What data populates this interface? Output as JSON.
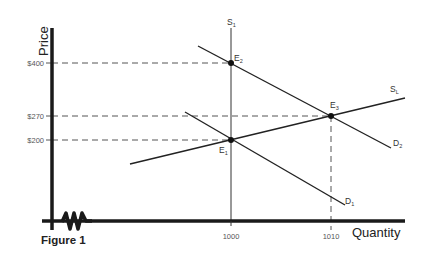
{
  "figure": {
    "caption": "Figure 1",
    "x_axis_title": "Quantity",
    "y_axis_title": "Price"
  },
  "y_ticks": [
    {
      "label": "$400",
      "value": 400
    },
    {
      "label": "$270",
      "value": 270
    },
    {
      "label": "$200",
      "value": 200
    }
  ],
  "x_ticks": [
    {
      "label": "1000",
      "value": 1000
    },
    {
      "label": "1010",
      "value": 1010
    }
  ],
  "curves": {
    "s1": {
      "main": "S",
      "sub": "1",
      "type": "short-run supply (vertical)"
    },
    "sl": {
      "main": "S",
      "sub": "L",
      "type": "long-run supply"
    },
    "d1": {
      "main": "D",
      "sub": "1",
      "type": "demand"
    },
    "d2": {
      "main": "D",
      "sub": "2",
      "type": "demand"
    }
  },
  "points": {
    "e1": {
      "main": "E",
      "sub": "1",
      "quantity": 1000,
      "price": 200
    },
    "e2": {
      "main": "E",
      "sub": "2",
      "quantity": 1000,
      "price": 400
    },
    "e3": {
      "main": "E",
      "sub": "3",
      "quantity": 1010,
      "price": 270
    }
  },
  "colors": {
    "axis": "#1a1a1a",
    "line": "#2a2a2a",
    "dashed": "#555555"
  }
}
